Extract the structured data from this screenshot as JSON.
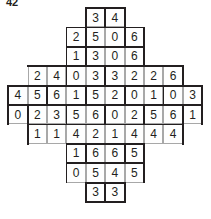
{
  "puzzle": {
    "label": "42",
    "type": "domino-grid-puzzle",
    "cell_size": 19.4,
    "origin_x": 8.2,
    "origin_y": 8.0,
    "colors": {
      "outline": "#231f20",
      "cell_border": "#a8a8a8",
      "cell_fill": "#fefefe",
      "digit": "#231f20",
      "page": "#ffffff"
    },
    "rows": [
      {
        "start_col": 4,
        "values": [
          3,
          4
        ]
      },
      {
        "start_col": 3,
        "values": [
          2,
          5,
          0,
          6
        ]
      },
      {
        "start_col": 3,
        "values": [
          1,
          3,
          0,
          6
        ]
      },
      {
        "start_col": 1,
        "values": [
          2,
          4,
          0,
          3,
          3,
          2,
          2,
          6
        ]
      },
      {
        "start_col": 0,
        "values": [
          4,
          5,
          6,
          1,
          5,
          2,
          0,
          1,
          0,
          3
        ]
      },
      {
        "start_col": 0,
        "values": [
          0,
          2,
          3,
          5,
          6,
          0,
          2,
          5,
          6,
          1
        ]
      },
      {
        "start_col": 1,
        "values": [
          1,
          1,
          4,
          2,
          1,
          4,
          4,
          4
        ]
      },
      {
        "start_col": 3,
        "values": [
          1,
          6,
          6,
          5
        ]
      },
      {
        "start_col": 3,
        "values": [
          0,
          5,
          4,
          5
        ]
      },
      {
        "start_col": 4,
        "values": [
          3,
          3
        ]
      }
    ],
    "domino_edges": {
      "horizontal": [
        [
          4,
          0,
          2
        ],
        [
          3,
          1,
          4
        ],
        [
          3,
          2,
          4
        ],
        [
          1,
          3,
          8
        ],
        [
          0,
          4,
          10
        ],
        [
          0,
          5,
          10
        ],
        [
          1,
          6,
          8
        ],
        [
          3,
          7,
          4
        ],
        [
          3,
          8,
          4
        ],
        [
          4,
          9,
          2
        ],
        [
          4,
          10,
          2
        ],
        [
          3,
          3,
          1
        ],
        [
          5,
          3,
          1
        ],
        [
          7,
          3,
          1
        ],
        [
          3,
          4,
          1
        ],
        [
          7,
          4,
          1
        ],
        [
          1,
          5,
          1
        ],
        [
          3,
          5,
          1
        ],
        [
          5,
          5,
          1
        ],
        [
          7,
          5,
          1
        ],
        [
          9,
          5,
          1
        ],
        [
          1,
          6,
          1
        ],
        [
          5,
          6,
          1
        ],
        [
          7,
          6,
          1
        ],
        [
          3,
          7,
          1
        ],
        [
          5,
          7,
          1
        ]
      ],
      "vertical": [
        [
          4,
          0,
          1
        ],
        [
          6,
          0,
          1
        ],
        [
          3,
          1,
          2
        ],
        [
          7,
          1,
          2
        ],
        [
          3,
          3,
          1
        ],
        [
          0,
          4,
          2
        ],
        [
          10,
          4,
          2
        ],
        [
          1,
          6,
          1
        ],
        [
          9,
          6,
          1
        ],
        [
          3,
          7,
          2
        ],
        [
          7,
          7,
          2
        ],
        [
          4,
          9,
          1
        ],
        [
          6,
          9,
          1
        ],
        [
          5,
          0,
          1
        ],
        [
          4,
          1,
          2
        ],
        [
          6,
          1,
          1
        ],
        [
          5,
          3,
          1
        ],
        [
          9,
          3,
          1
        ],
        [
          2,
          4,
          1
        ],
        [
          4,
          4,
          1
        ],
        [
          6,
          4,
          1
        ],
        [
          8,
          4,
          1
        ],
        [
          1,
          5,
          1
        ],
        [
          3,
          5,
          1
        ],
        [
          5,
          5,
          1
        ],
        [
          7,
          5,
          1
        ],
        [
          9,
          5,
          1
        ],
        [
          4,
          7,
          1
        ],
        [
          6,
          7,
          1
        ],
        [
          5,
          9,
          1
        ]
      ]
    }
  }
}
